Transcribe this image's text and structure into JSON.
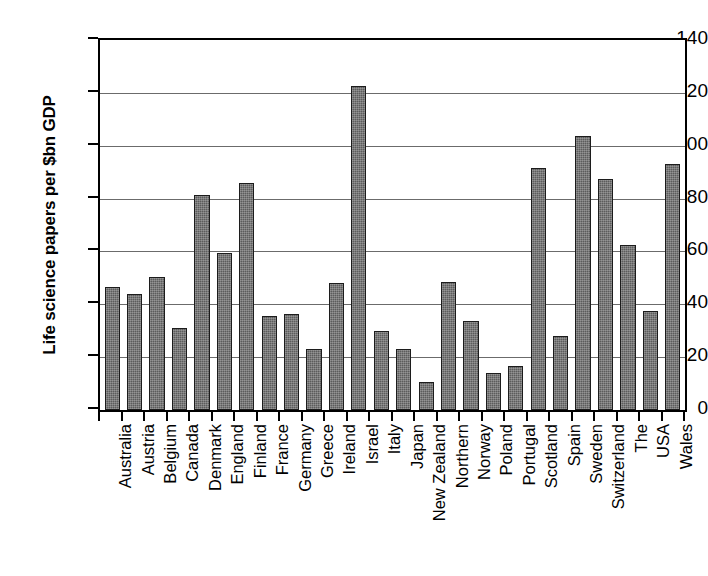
{
  "chart_data": {
    "type": "bar",
    "title": "",
    "subtitle": "",
    "xlabel": "",
    "ylabel": "Life science papers per $bn GDP",
    "ylim": [
      0,
      140
    ],
    "ytick_interval": 20,
    "yticks": [
      140,
      120,
      100,
      80,
      60,
      40,
      20,
      0
    ],
    "grid": true,
    "legend": false,
    "legend_position": "none",
    "bar_color": "#5c5c5c",
    "bar_edge_color": "#1c1c1c",
    "categories": [
      "Australia",
      "Austria",
      "Belgium",
      "Canada",
      "Denmark",
      "England",
      "Finland",
      "France",
      "Germany",
      "Greece",
      "Ireland",
      "Israel",
      "Italy",
      "Japan",
      "New Zealand",
      "Northern",
      "Norway",
      "Poland",
      "Portugal",
      "Scotland",
      "Spain",
      "Sweden",
      "Switzerland",
      "The",
      "USA",
      "Wales"
    ],
    "values": [
      46.5,
      44,
      50.5,
      31,
      81.5,
      59.5,
      86,
      35.5,
      36.5,
      23,
      48,
      122.5,
      30,
      23,
      10.5,
      48.5,
      33.5,
      14,
      16.5,
      91.5,
      28,
      103.5,
      87.5,
      62.5,
      37.5,
      93
    ]
  }
}
